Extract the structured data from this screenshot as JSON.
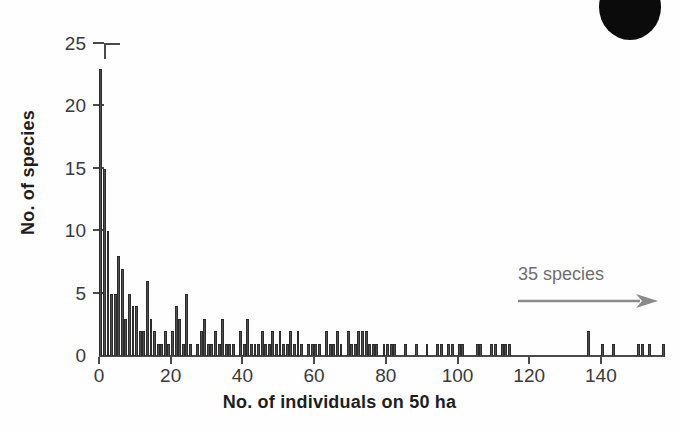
{
  "figure": {
    "corner_mark": "black-ellipse-artifact"
  },
  "chart_data": {
    "type": "bar",
    "title": "",
    "subtitle": "",
    "xlabel": "No. of individuals on 50 ha",
    "ylabel": "No. of species",
    "xlim": [
      -1,
      158
    ],
    "ylim": [
      0,
      25
    ],
    "grid": false,
    "legend_position": "none",
    "bar_color": "#4e4e4e",
    "axis_color": "#4a4a4a",
    "annotation_color": "#6e6e6e",
    "x_ticks": [
      0,
      20,
      40,
      60,
      80,
      100,
      120,
      140
    ],
    "x_tick_labels": [
      "0",
      "20",
      "40",
      "60",
      "80",
      "100",
      "120",
      "140"
    ],
    "y_ticks": [
      0,
      5,
      10,
      15,
      20,
      25
    ],
    "y_tick_labels": [
      "0",
      "5",
      "10",
      "15",
      "20",
      "25"
    ],
    "annotations": [
      {
        "text": "35 species",
        "arrow": "right-arrow",
        "x": 128,
        "y": 7
      }
    ],
    "x": [
      0,
      1,
      2,
      3,
      4,
      5,
      6,
      7,
      8,
      9,
      10,
      11,
      12,
      13,
      14,
      15,
      16,
      17,
      18,
      19,
      20,
      21,
      22,
      23,
      24,
      25,
      26,
      27,
      28,
      29,
      30,
      31,
      32,
      33,
      34,
      35,
      36,
      37,
      38,
      39,
      40,
      41,
      42,
      43,
      44,
      45,
      46,
      47,
      48,
      49,
      50,
      51,
      52,
      53,
      54,
      55,
      56,
      57,
      58,
      59,
      60,
      61,
      62,
      63,
      64,
      65,
      66,
      67,
      68,
      69,
      70,
      71,
      72,
      73,
      74,
      75,
      76,
      77,
      78,
      79,
      80,
      81,
      82,
      83,
      84,
      85,
      86,
      87,
      88,
      89,
      90,
      91,
      92,
      93,
      94,
      95,
      96,
      97,
      98,
      99,
      100,
      101,
      102,
      103,
      104,
      105,
      106,
      107,
      108,
      109,
      110,
      111,
      112,
      113,
      114,
      115,
      116,
      117,
      118,
      119,
      120,
      121,
      122,
      123,
      124,
      125,
      126,
      127,
      128,
      129,
      130,
      131,
      132,
      133,
      134,
      135,
      136,
      137,
      138,
      139,
      140,
      141,
      142,
      143,
      144,
      145,
      146,
      147,
      148,
      149,
      150,
      151,
      152,
      153,
      154,
      155,
      156,
      157
    ],
    "values": [
      23,
      15,
      10,
      5,
      5,
      8,
      7,
      3,
      5,
      4,
      4,
      2,
      2,
      6,
      3,
      2,
      1,
      1,
      2,
      1,
      2,
      4,
      3,
      1,
      5,
      1,
      0,
      1,
      2,
      3,
      1,
      1,
      2,
      1,
      3,
      1,
      1,
      1,
      0,
      2,
      1,
      3,
      1,
      1,
      1,
      2,
      1,
      1,
      2,
      1,
      2,
      1,
      1,
      2,
      1,
      2,
      1,
      0,
      1,
      1,
      1,
      1,
      0,
      2,
      1,
      1,
      2,
      1,
      0,
      2,
      1,
      1,
      2,
      2,
      2,
      1,
      1,
      1,
      0,
      1,
      1,
      1,
      1,
      0,
      0,
      1,
      0,
      0,
      1,
      0,
      0,
      1,
      0,
      0,
      1,
      1,
      0,
      1,
      1,
      0,
      1,
      1,
      0,
      0,
      0,
      1,
      1,
      0,
      0,
      1,
      1,
      0,
      1,
      1,
      1,
      0,
      0,
      0,
      0,
      0,
      0,
      0,
      0,
      0,
      0,
      0,
      0,
      0,
      0,
      0,
      0,
      0,
      0,
      0,
      0,
      0,
      2,
      0,
      0,
      0,
      1,
      0,
      0,
      1,
      0,
      0,
      0,
      0,
      0,
      0,
      1,
      1,
      0,
      1,
      0,
      0,
      0,
      1
    ]
  }
}
